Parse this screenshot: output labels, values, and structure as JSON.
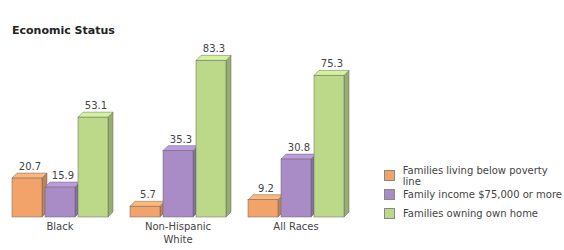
{
  "chart_data": {
    "type": "bar",
    "title": "Economic Status",
    "xlabel": "",
    "ylabel": "",
    "categories": [
      "Black",
      "Non-Hispanic\nWhite",
      "All Races"
    ],
    "series": [
      {
        "name": "Families living below poverty line",
        "color": "#f2a36a",
        "values": [
          20.7,
          5.7,
          9.2
        ]
      },
      {
        "name": "Family income $75,000 or more",
        "color": "#a98bc6",
        "values": [
          15.9,
          35.3,
          30.8
        ]
      },
      {
        "name": "Families owning own home",
        "color": "#bcd98a",
        "values": [
          53.1,
          83.3,
          75.3
        ]
      }
    ],
    "ylim": [
      0,
      90
    ],
    "grid": false,
    "legend_position": "right"
  }
}
